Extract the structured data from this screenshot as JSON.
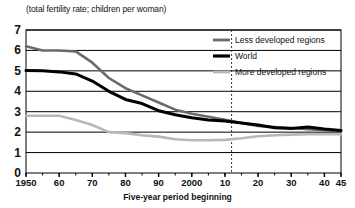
{
  "chart_data": {
    "type": "line",
    "title": "",
    "subtitle": "(total fertility rate; children per woman)",
    "xlabel": "Five-year period beginning",
    "ylabel": "",
    "ylim": [
      0,
      7
    ],
    "xlim": [
      1950,
      2045
    ],
    "grid": true,
    "legend_position": "top-right",
    "y_ticks": [
      "7",
      "6",
      "5",
      "4",
      "3",
      "2",
      "1",
      "0"
    ],
    "y_tick_values": [
      7,
      6,
      5,
      4,
      3,
      2,
      1,
      0
    ],
    "x_ticks": [
      "1950",
      "60",
      "70",
      "80",
      "90",
      "2000",
      "10",
      "20",
      "30",
      "40",
      "45"
    ],
    "x_tick_values": [
      1950,
      1960,
      1970,
      1980,
      1990,
      2000,
      2010,
      2020,
      2030,
      2040,
      2045
    ],
    "annotations": [
      {
        "name": "projection-divider",
        "type": "vertical-dashed-line",
        "x": 2012,
        "label": ""
      }
    ],
    "x": [
      1950,
      1955,
      1960,
      1965,
      1970,
      1975,
      1980,
      1985,
      1990,
      1995,
      2000,
      2005,
      2010,
      2015,
      2020,
      2025,
      2030,
      2035,
      2040,
      2045
    ],
    "series": [
      {
        "name": "Less developed regions",
        "color": "#6b6b6b",
        "values": [
          6.2,
          6.0,
          6.0,
          5.95,
          5.4,
          4.65,
          4.15,
          3.8,
          3.45,
          3.1,
          2.9,
          2.75,
          2.6,
          2.45,
          2.3,
          2.25,
          2.2,
          2.15,
          2.1,
          2.05
        ]
      },
      {
        "name": "World",
        "color": "#000000",
        "values": [
          5.02,
          5.0,
          4.95,
          4.85,
          4.5,
          4.0,
          3.6,
          3.4,
          3.05,
          2.85,
          2.7,
          2.6,
          2.55,
          2.45,
          2.35,
          2.22,
          2.18,
          2.25,
          2.15,
          2.08
        ]
      },
      {
        "name": "More developed regions",
        "color": "#b8b8b8",
        "values": [
          2.8,
          2.8,
          2.8,
          2.6,
          2.35,
          2.0,
          1.95,
          1.85,
          1.78,
          1.65,
          1.6,
          1.6,
          1.62,
          1.7,
          1.8,
          1.85,
          1.88,
          1.9,
          1.9,
          1.9
        ]
      }
    ]
  },
  "legend": {
    "items": [
      {
        "label": "Less developed regions"
      },
      {
        "label": "World"
      },
      {
        "label": "More developed regions"
      }
    ]
  }
}
